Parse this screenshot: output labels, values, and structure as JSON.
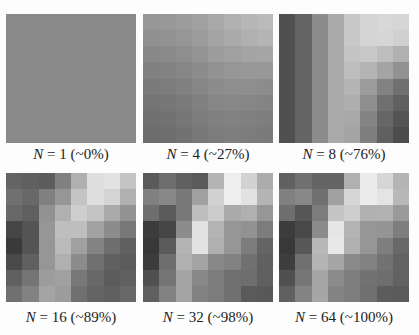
{
  "panels": [
    {
      "n": "1",
      "pct": "~0%",
      "caption_rest": " = 1 (~0%)",
      "grid": [
        [
          138,
          138,
          138,
          138,
          138,
          138,
          138,
          138
        ],
        [
          138,
          138,
          138,
          138,
          138,
          138,
          138,
          138
        ],
        [
          138,
          138,
          138,
          138,
          138,
          138,
          138,
          138
        ],
        [
          138,
          138,
          138,
          138,
          138,
          138,
          138,
          138
        ],
        [
          138,
          138,
          138,
          138,
          138,
          138,
          138,
          138
        ],
        [
          138,
          138,
          138,
          138,
          138,
          138,
          138,
          138
        ],
        [
          138,
          138,
          138,
          138,
          138,
          138,
          138,
          138
        ],
        [
          138,
          138,
          138,
          138,
          138,
          138,
          138,
          138
        ]
      ]
    },
    {
      "n": "4",
      "pct": "~27%",
      "caption_rest": " = 4 (~27%)",
      "grid": [
        [
          150,
          152,
          156,
          160,
          168,
          176,
          182,
          186
        ],
        [
          144,
          146,
          150,
          156,
          164,
          170,
          176,
          180
        ],
        [
          136,
          138,
          142,
          148,
          156,
          160,
          164,
          166
        ],
        [
          128,
          130,
          134,
          140,
          146,
          150,
          152,
          152
        ],
        [
          122,
          124,
          128,
          134,
          140,
          142,
          142,
          140
        ],
        [
          116,
          118,
          122,
          128,
          134,
          136,
          134,
          132
        ],
        [
          112,
          114,
          118,
          124,
          128,
          130,
          128,
          126
        ],
        [
          108,
          110,
          114,
          120,
          124,
          126,
          124,
          122
        ]
      ]
    },
    {
      "n": "8",
      "pct": "~76%",
      "caption_rest": " = 8 (~76%)",
      "grid": [
        [
          80,
          100,
          140,
          170,
          200,
          212,
          216,
          214
        ],
        [
          80,
          100,
          140,
          170,
          200,
          212,
          214,
          208
        ],
        [
          80,
          100,
          140,
          170,
          196,
          200,
          190,
          176
        ],
        [
          80,
          100,
          140,
          170,
          190,
          180,
          164,
          146
        ],
        [
          80,
          100,
          140,
          170,
          180,
          156,
          130,
          112
        ],
        [
          80,
          100,
          140,
          170,
          174,
          142,
          112,
          96
        ],
        [
          80,
          100,
          140,
          170,
          168,
          132,
          102,
          84
        ],
        [
          80,
          100,
          140,
          170,
          164,
          126,
          96,
          76
        ]
      ]
    },
    {
      "n": "16",
      "pct": "~89%",
      "caption_rest": " = 16 (~89%)",
      "grid": [
        [
          100,
          96,
          92,
          128,
          176,
          222,
          226,
          196
        ],
        [
          112,
          104,
          128,
          150,
          196,
          222,
          212,
          176
        ],
        [
          104,
          96,
          146,
          176,
          206,
          196,
          170,
          146
        ],
        [
          70,
          84,
          150,
          190,
          190,
          162,
          140,
          120
        ],
        [
          58,
          84,
          150,
          186,
          160,
          132,
          110,
          96
        ],
        [
          74,
          96,
          150,
          176,
          140,
          112,
          96,
          92
        ],
        [
          96,
          116,
          156,
          160,
          120,
          104,
          92,
          96
        ],
        [
          112,
          130,
          164,
          156,
          112,
          100,
          96,
          104
        ]
      ]
    },
    {
      "n": "32",
      "pct": "~98%",
      "caption_rest": " = 32 (~98%)",
      "grid": [
        [
          90,
          110,
          96,
          90,
          180,
          238,
          210,
          172
        ],
        [
          128,
          136,
          120,
          160,
          210,
          238,
          226,
          180
        ],
        [
          110,
          90,
          120,
          190,
          204,
          170,
          176,
          150
        ],
        [
          60,
          70,
          140,
          226,
          180,
          150,
          146,
          124
        ],
        [
          56,
          90,
          180,
          226,
          176,
          150,
          124,
          100
        ],
        [
          60,
          110,
          176,
          164,
          136,
          130,
          112,
          96
        ],
        [
          80,
          116,
          164,
          136,
          124,
          112,
          110,
          96
        ],
        [
          96,
          130,
          164,
          130,
          124,
          112,
          90,
          88
        ]
      ]
    },
    {
      "n": "64",
      "pct": "~100%",
      "caption_rest": " = 64 (~100%)",
      "grid": [
        [
          96,
          112,
          100,
          100,
          176,
          236,
          214,
          180
        ],
        [
          128,
          136,
          112,
          160,
          214,
          236,
          228,
          184
        ],
        [
          110,
          86,
          124,
          196,
          206,
          176,
          178,
          154
        ],
        [
          60,
          72,
          140,
          230,
          180,
          150,
          148,
          126
        ],
        [
          56,
          88,
          184,
          232,
          176,
          150,
          126,
          104
        ],
        [
          62,
          112,
          180,
          166,
          138,
          130,
          114,
          98
        ],
        [
          80,
          118,
          166,
          140,
          126,
          114,
          110,
          98
        ],
        [
          96,
          132,
          166,
          132,
          126,
          112,
          92,
          90
        ]
      ]
    }
  ],
  "layout": {
    "cols_x": [
      6,
      143,
      279
    ],
    "rows_y": [
      14,
      173
    ],
    "panel_w": 130,
    "panel_h": 129,
    "caption_y": [
      146,
      309
    ]
  }
}
